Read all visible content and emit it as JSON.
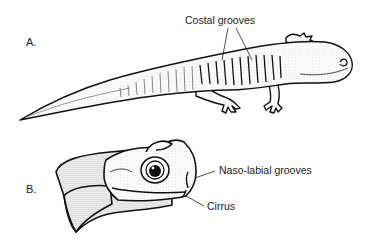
{
  "figure": {
    "panels": [
      {
        "letter": "A.",
        "subject": "salamander-full-body-lateral-view",
        "labels": [
          {
            "text": "Costal grooves",
            "target": "costal-grooves"
          }
        ]
      },
      {
        "letter": "B.",
        "subject": "salamander-head-lateral-view",
        "labels": [
          {
            "text": "Naso-labial grooves",
            "target": "naso-labial-grooves"
          },
          {
            "text": "Cirrus",
            "target": "cirrus"
          }
        ]
      }
    ]
  }
}
